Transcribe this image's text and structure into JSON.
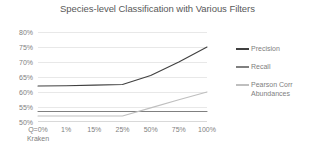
{
  "chart_data": {
    "type": "line",
    "title": "Species-level Classification with Various Filters",
    "xlabel": "",
    "ylabel": "",
    "categories": [
      "Q=0% Kraken",
      "1%",
      "15%",
      "25%",
      "50%",
      "75%",
      "100%"
    ],
    "category_lines": [
      [
        "Q=0%",
        "Kraken"
      ],
      [
        "1%",
        ""
      ],
      [
        "15%",
        ""
      ],
      [
        "25%",
        ""
      ],
      [
        "50%",
        ""
      ],
      [
        "75%",
        ""
      ],
      [
        "100%",
        ""
      ]
    ],
    "ylim": [
      50,
      80
    ],
    "yticks": [
      "50%",
      "55%",
      "60%",
      "65%",
      "70%",
      "75%",
      "80%"
    ],
    "ytick_values": [
      50,
      55,
      60,
      65,
      70,
      75,
      80
    ],
    "grid": true,
    "legend_position": "right",
    "series": [
      {
        "name": "Precision",
        "color": "#404040",
        "values": [
          62.0,
          62.1,
          62.3,
          62.5,
          65.5,
          70.0,
          75.0
        ]
      },
      {
        "name": "Recall",
        "color": "#808080",
        "values": [
          53.5,
          53.5,
          53.5,
          53.5,
          53.5,
          53.5,
          53.5
        ]
      },
      {
        "name": "Pearson Corr Abundances",
        "color": "#bfbfbf",
        "values": [
          52.0,
          52.0,
          52.0,
          52.0,
          54.7,
          57.4,
          60.0
        ]
      }
    ]
  },
  "legend": {
    "items": [
      {
        "label": "Precision"
      },
      {
        "label": "Recall"
      },
      {
        "label": "Pearson Corr Abundances"
      }
    ]
  }
}
